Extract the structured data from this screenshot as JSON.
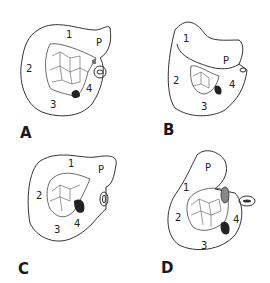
{
  "figure": {
    "panels": [
      {
        "id": "A",
        "letter": "A",
        "labels": {
          "one": "1",
          "two": "2",
          "three": "3",
          "four": "4",
          "p": "P"
        }
      },
      {
        "id": "B",
        "letter": "B",
        "labels": {
          "one": "1",
          "two": "2",
          "three": "3",
          "four": "4",
          "p": "P"
        }
      },
      {
        "id": "C",
        "letter": "C",
        "labels": {
          "one": "1",
          "two": "2",
          "three": "3",
          "four": "4",
          "p": "P"
        }
      },
      {
        "id": "D",
        "letter": "D",
        "labels": {
          "one": "1",
          "two": "2",
          "three": "3",
          "four": "4",
          "p": "P"
        }
      }
    ],
    "colors": {
      "line": "#333333",
      "background": "#ffffff",
      "hatch": "#222222"
    }
  }
}
